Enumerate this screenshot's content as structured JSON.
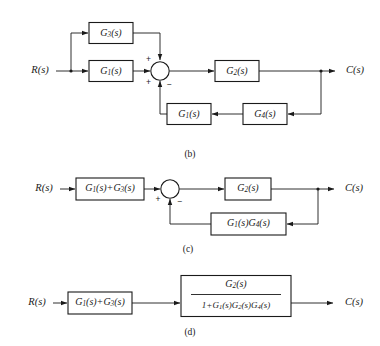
{
  "figure": {
    "kind": "control-system-block-diagram-series",
    "panels": [
      {
        "caption": "(b)",
        "input_label": "R(s)",
        "output_label": "C(s)",
        "blocks": [
          {
            "id": "g3-top",
            "label_base": "G",
            "label_sub": "3",
            "label_tail": "(s)",
            "label_full": "G3(s)"
          },
          {
            "id": "g1-forward",
            "label_base": "G",
            "label_sub": "1",
            "label_tail": "(s)",
            "label_full": "G1(s)"
          },
          {
            "id": "g2-plant",
            "label_base": "G",
            "label_sub": "2",
            "label_tail": "(s)",
            "label_full": "G2(s)"
          },
          {
            "id": "g1-feedback",
            "label_base": "G",
            "label_sub": "1",
            "label_tail": "(s)",
            "label_full": "G1(s)"
          },
          {
            "id": "g4-feedback",
            "label_base": "G",
            "label_sub": "4",
            "label_tail": "(s)",
            "label_full": "G4(s)"
          }
        ],
        "summing_junction": {
          "sign_top_left": "+",
          "sign_bottom_left": "+",
          "sign_bottom": "−"
        }
      },
      {
        "caption": "(c)",
        "input_label": "R(s)",
        "output_label": "C(s)",
        "blocks": [
          {
            "id": "g1-plus-g3",
            "label_full": "G1(s)+G3(s)"
          },
          {
            "id": "g2-plant-c",
            "label_full": "G2(s)"
          },
          {
            "id": "g1g4-feedback",
            "label_full": "G1(s)G4(s)"
          }
        ],
        "summing_junction": {
          "sign_left": "+",
          "sign_bottom": "−"
        }
      },
      {
        "caption": "(d)",
        "input_label": "R(s)",
        "output_label": "C(s)",
        "blocks": [
          {
            "id": "g1-plus-g3-d",
            "label_full": "G1(s)+G3(s)"
          },
          {
            "id": "closed-loop-tf",
            "numerator": "G2(s)",
            "denominator": "1+G1(s)G2(s)G4(s)"
          }
        ]
      }
    ]
  },
  "panel_b": {
    "caption": "(b)",
    "input": "R(s)",
    "output": "C(s)",
    "g3": {
      "base": "G",
      "sub": "3",
      "tail": "(s)"
    },
    "g1f": {
      "base": "G",
      "sub": "1",
      "tail": "(s)"
    },
    "g2": {
      "base": "G",
      "sub": "2",
      "tail": "(s)"
    },
    "g1b": {
      "base": "G",
      "sub": "1",
      "tail": "(s)"
    },
    "g4b": {
      "base": "G",
      "sub": "4",
      "tail": "(s)"
    },
    "sign_plus_top": "+",
    "sign_plus_bottom": "+",
    "sign_minus": "−"
  },
  "panel_c": {
    "caption": "(c)",
    "input": "R(s)",
    "output": "C(s)",
    "sum_block": {
      "b1": "G",
      "s1": "1",
      "t1": "(s)+",
      "b2": "G",
      "s2": "3",
      "t2": "(s)"
    },
    "g2": {
      "base": "G",
      "sub": "2",
      "tail": "(s)"
    },
    "feedback": {
      "b1": "G",
      "s1": "1",
      "t1": "(s)",
      "b2": "G",
      "s2": "4",
      "t2": "(s)"
    },
    "sign_plus": "+",
    "sign_minus": "−"
  },
  "panel_d": {
    "caption": "(d)",
    "input": "R(s)",
    "output": "C(s)",
    "sum_block": {
      "b1": "G",
      "s1": "1",
      "t1": "(s)+",
      "b2": "G",
      "s2": "3",
      "t2": "(s)"
    },
    "numerator": {
      "base": "G",
      "sub": "2",
      "tail": "(s)"
    },
    "denominator": {
      "lead": "1+",
      "b1": "G",
      "s1": "1",
      "t1": "(s)",
      "b2": "G",
      "s2": "2",
      "t2": "(s)",
      "b3": "G",
      "s3": "4",
      "t3": "(s)"
    }
  },
  "colors": {
    "ink": "#1a1a1a",
    "paper": "#ffffff"
  }
}
